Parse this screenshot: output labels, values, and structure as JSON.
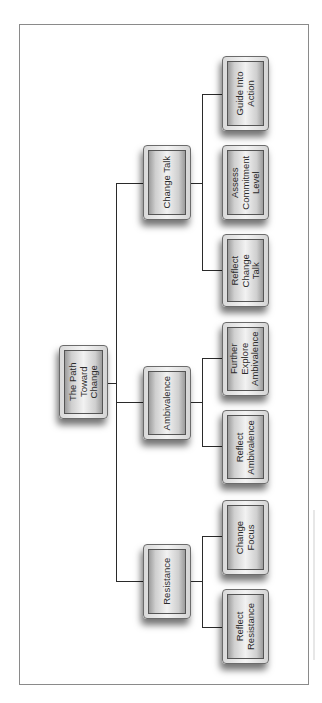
{
  "diagram": {
    "type": "tree",
    "orientation": "rotated-90",
    "root": {
      "id": "root",
      "label": "The Path\nToward\nChange"
    },
    "branches": [
      {
        "id": "change-talk",
        "label": "Change Talk",
        "children": [
          {
            "id": "guide-into-action",
            "label": "Guide Into\nAction"
          },
          {
            "id": "assess-commitment-level",
            "label": "Assess\nCommitment\nLevel"
          },
          {
            "id": "reflect-change-talk",
            "label": "Reflect\nChange\nTalk"
          }
        ]
      },
      {
        "id": "ambivalence",
        "label": "Ambivalence",
        "children": [
          {
            "id": "further-explore-ambivalence",
            "label": "Further\nExplore\nAmbivalence"
          },
          {
            "id": "reflect-ambivalence",
            "label": "Reflect\nAmbivalence"
          }
        ]
      },
      {
        "id": "resistance",
        "label": "Resistance",
        "children": [
          {
            "id": "change-focus",
            "label": "Change\nFocus"
          },
          {
            "id": "reflect-resistance",
            "label": "Reflect\nResistance"
          }
        ]
      }
    ]
  },
  "colors": {
    "connector": "#2a2a2a",
    "frame_border": "#8a8a8a",
    "node_border": "#555555",
    "text": "#2a2a2a"
  }
}
